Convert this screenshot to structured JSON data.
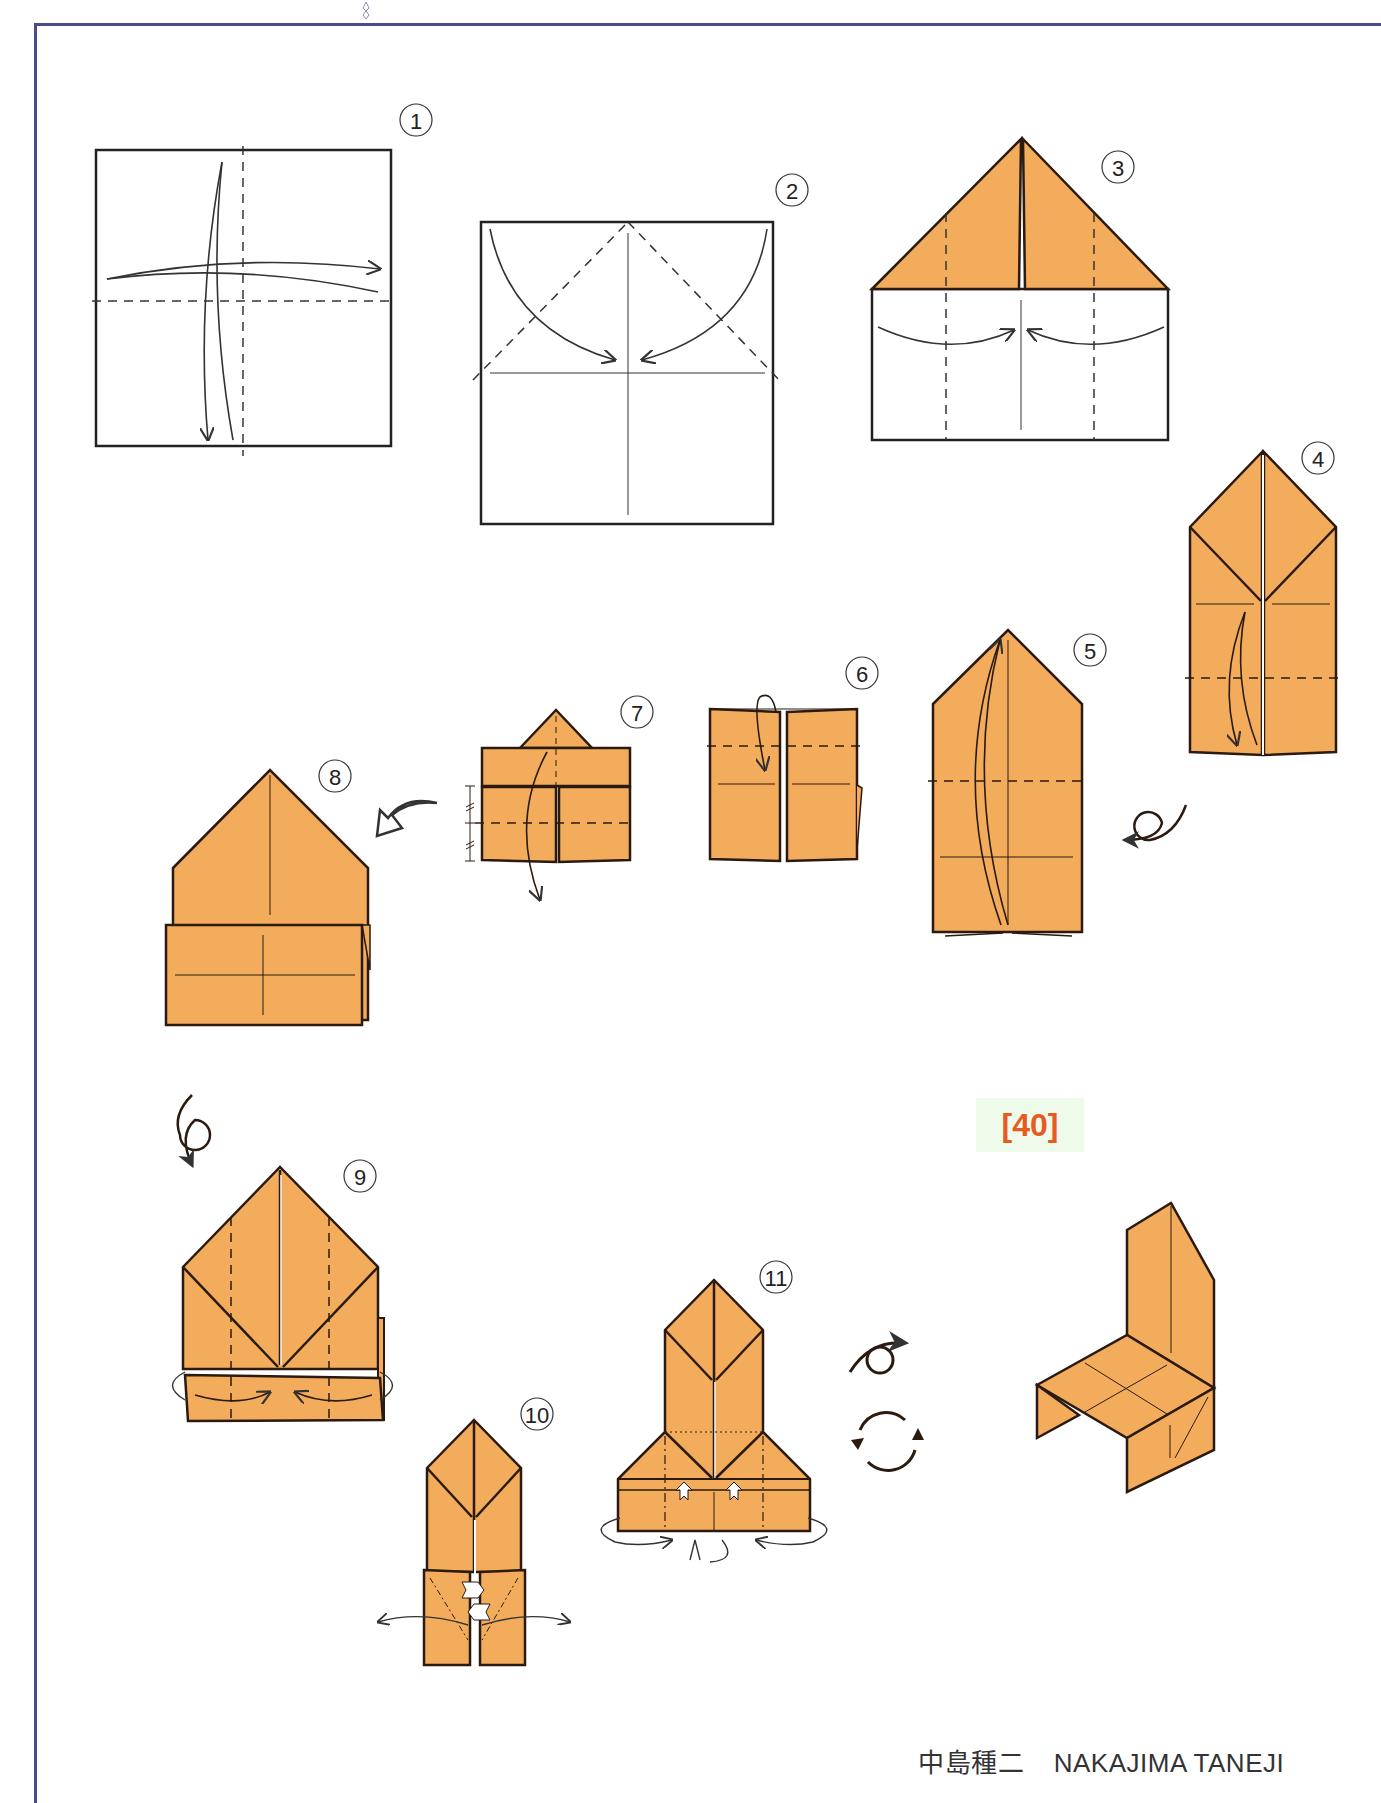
{
  "page": {
    "top_caption_fragment": "p ③, y f  y  ...  ... n ... fo ... e ... f ... l ...",
    "page_number": "[40]",
    "author_japanese": "中島種二",
    "author_romaji": "NAKAJIMA TANEJI"
  },
  "colors": {
    "paper_orange": "#f2ac5c",
    "outline": "#2a1a10",
    "frame": "#4a4a8c",
    "page_number_text": "#e85a24",
    "page_number_bg": "#eefaea"
  },
  "steps": [
    {
      "number": "1",
      "label": "①",
      "description": "Square, fold in half both ways and unfold (valley folds)"
    },
    {
      "number": "2",
      "label": "②",
      "description": "Fold top corners to center line"
    },
    {
      "number": "3",
      "label": "③",
      "description": "Fold sides to center (valley folds)"
    },
    {
      "number": "4",
      "label": "④",
      "description": "Fold bottom up along dashed line"
    },
    {
      "number": "5",
      "label": "⑤",
      "description": "Fold down; then turn over"
    },
    {
      "number": "6",
      "label": "⑥",
      "description": "Fold top flap down"
    },
    {
      "number": "7",
      "label": "⑦",
      "description": "Fold flap down at halfway mark"
    },
    {
      "number": "8",
      "label": "⑧",
      "description": "Result; turn over"
    },
    {
      "number": "9",
      "label": "⑨",
      "description": "Fold sides to center, tucking bottom"
    },
    {
      "number": "10",
      "label": "⑩",
      "description": "Open pockets outward"
    },
    {
      "number": "11",
      "label": "⑪",
      "description": "Fold legs; turn over and rotate"
    }
  ],
  "symbols": {
    "turn_over": "turn-over-icon",
    "rotate": "rotate-icon",
    "push_arrow": "push-arrow-icon"
  },
  "result": {
    "label": "chair",
    "description": "Finished origami chair"
  }
}
